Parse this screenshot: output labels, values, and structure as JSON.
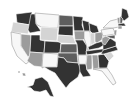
{
  "map": {
    "type": "choropleth",
    "region": "United States",
    "palette": {
      "white": "#f7f7f7",
      "light": "#d4d4d4",
      "mid": "#9c9c9c",
      "darkmid": "#5e5e5e",
      "dark": "#333333"
    },
    "states": [
      {
        "id": "WA",
        "shade": "dark",
        "points": "16,14 32,12 31,25 17,23"
      },
      {
        "id": "OR",
        "shade": "light",
        "points": "13,22 30,25 28,34 11,32"
      },
      {
        "id": "CA",
        "shade": "white",
        "points": "11,32 21,34 21,46 31,60 26,64 17,56 12,45"
      },
      {
        "id": "NV",
        "shade": "mid",
        "points": "21,34 31,35 30,55 28,57 21,46"
      },
      {
        "id": "ID",
        "shade": "dark",
        "points": "31,14 35,14 36,24 41,31 30,33 28,30"
      },
      {
        "id": "MT",
        "shade": "white",
        "points": "35,13 59,15 58,28 41,27 36,24"
      },
      {
        "id": "WY",
        "shade": "light",
        "points": "41,27 58,28 57,41 40,40"
      },
      {
        "id": "UT",
        "shade": "dark",
        "points": "31,35 40,35 40,40 45,41 44,53 30,52"
      },
      {
        "id": "AZ",
        "shade": "mid",
        "points": "30,52 43,53 42,67 34,66 27,61 29,57"
      },
      {
        "id": "CO",
        "shade": "dark",
        "points": "45,41 61,42 60,53 44,53"
      },
      {
        "id": "NM",
        "shade": "white",
        "points": "43,53 58,54 57,67 44,67 42,68"
      },
      {
        "id": "ND",
        "shade": "darkmid",
        "points": "59,15 73,16 73,26 59,26"
      },
      {
        "id": "SD",
        "shade": "dark",
        "points": "59,26 73,26 73,36 58,35"
      },
      {
        "id": "NE",
        "shade": "light",
        "points": "58,35 73,36 76,44 61,43 57,41"
      },
      {
        "id": "KS",
        "shade": "darkmid",
        "points": "61,44 77,44 77,53 60,53"
      },
      {
        "id": "OK",
        "shade": "darkmid",
        "points": "58,53 77,53 78,63 67,62 64,58 58,57"
      },
      {
        "id": "TX",
        "shade": "dark",
        "points": "58,57 64,58 67,62 78,63 81,69 78,77 70,83 66,88 60,80 55,73 49,70 44,67 57,67"
      },
      {
        "id": "MN",
        "shade": "dark",
        "points": "73,16 83,17 82,25 84,31 74,31"
      },
      {
        "id": "IA",
        "shade": "mid",
        "points": "74,31 84,31 86,37 83,40 75,40"
      },
      {
        "id": "MO",
        "shade": "dark",
        "points": "75,40 83,40 87,46 86,55 78,55 77,44"
      },
      {
        "id": "AR",
        "shade": "white",
        "points": "78,55 87,55 86,64 79,64"
      },
      {
        "id": "LA",
        "shade": "dark",
        "points": "79,64 86,64 87,70 91,76 83,77 80,72"
      },
      {
        "id": "WI",
        "shade": "dark",
        "points": "82,20 89,22 90,31 84,31"
      },
      {
        "id": "IL",
        "shade": "white",
        "points": "84,31 90,31 91,45 88,51 86,44 84,38"
      },
      {
        "id": "MI",
        "shade": "dark",
        "points": "89,23 97,26 99,32 93,34 90,31"
      },
      {
        "id": "IN",
        "shade": "light",
        "points": "90,33 95,33 95,43 91,45"
      },
      {
        "id": "OH",
        "shade": "mid",
        "points": "95,33 102,32 103,39 97,43 95,42"
      },
      {
        "id": "KY",
        "shade": "dark",
        "points": "88,47 96,43 103,41 106,44 99,48 89,50"
      },
      {
        "id": "TN",
        "shade": "dark",
        "points": "86,51 102,49 106,48 104,52 87,55"
      },
      {
        "id": "MS",
        "shade": "mid",
        "points": "87,55 92,55 92,69 87,70 86,64"
      },
      {
        "id": "AL",
        "shade": "mid",
        "points": "92,55 98,55 99,68 93,69"
      },
      {
        "id": "GA",
        "shade": "dark",
        "points": "98,55 104,54 109,61 107,68 99,68"
      },
      {
        "id": "FL",
        "shade": "white",
        "points": "93,69 107,68 112,75 116,83 113,85 106,76 102,71"
      },
      {
        "id": "SC",
        "shade": "light",
        "points": "104,54 111,52 114,56 109,61"
      },
      {
        "id": "NC",
        "shade": "dark",
        "points": "103,50 116,46 118,50 111,52 104,54 101,54"
      },
      {
        "id": "VA",
        "shade": "dark",
        "points": "103,44 110,38 116,42 116,46 103,50"
      },
      {
        "id": "WV",
        "shade": "mid",
        "points": "102,38 106,36 110,38 105,45 102,43"
      },
      {
        "id": "PA",
        "shade": "white",
        "points": "101,30 113,28 115,34 103,36"
      },
      {
        "id": "NY",
        "shade": "white",
        "points": "103,28 110,21 118,19 119,27 113,28"
      },
      {
        "id": "NJ",
        "shade": "mid",
        "points": "114,30 117,30 116,36 114,35"
      },
      {
        "id": "MD",
        "shade": "darkmid",
        "points": "106,36 115,35 115,39 110,38"
      },
      {
        "id": "ME",
        "shade": "dark",
        "points": "122,8 127,10 129,17 124,21 121,18"
      },
      {
        "id": "VT",
        "shade": "mid",
        "points": "117,18 120,17 120,24 118,24"
      },
      {
        "id": "NH",
        "shade": "darkmid",
        "points": "120,16 123,19 122,24 120,24"
      },
      {
        "id": "MA",
        "shade": "dark",
        "points": "118,24 124,23 126,26 118,26"
      },
      {
        "id": "CT",
        "shade": "mid",
        "points": "118,26 122,26 122,29 118,29"
      },
      {
        "id": "AK",
        "shade": "dark",
        "points": "35,79 42,77 48,82 52,92 54,97 50,96 46,90 40,92 34,91 31,88 27,87 33,85"
      },
      {
        "id": "HI",
        "shade": "mid",
        "points": "18,71 20,71 20,73 18,73"
      },
      {
        "id": "HI2",
        "shade": "mid",
        "points": "22,73 25,73 26,76 23,76"
      }
    ]
  }
}
